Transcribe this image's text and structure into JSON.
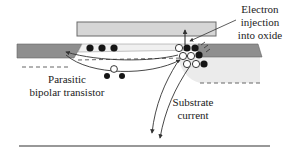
{
  "diagram": {
    "type": "MOSFET cross-section (hot-carrier effects)",
    "labels": {
      "electron_injection_line1": "Electron",
      "electron_injection_line2": "injection",
      "electron_injection_line3": "into oxide",
      "parasitic_line1": "Parasitic",
      "parasitic_line2": "bipolar transistor",
      "substrate_line1": "Substrate",
      "substrate_line2": "current"
    },
    "colors": {
      "gate": "#d6d6d6",
      "gate_stroke": "#6a6a6a",
      "source_drain": "#8c8c8c",
      "depletion": "#e9e9e9",
      "channel": "#f2f2f2",
      "filled_carrier": "#151515",
      "hollow_carrier": "#ffffff",
      "line": "#333333"
    },
    "carriers": {
      "electrons_filled": 9,
      "holes_hollow": 7
    }
  }
}
